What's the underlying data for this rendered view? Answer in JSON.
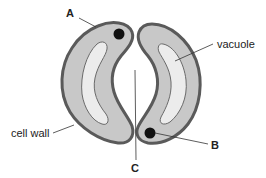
{
  "diagram": {
    "labels": {
      "a": "A",
      "b": "B",
      "c": "C",
      "vacuole": "vacuole",
      "cell_wall": "cell wall"
    },
    "colors": {
      "wall": "#5a5a5a",
      "cytoplasm": "#c8c8c8",
      "vacuole": "#ececec",
      "nucleus": "#111111",
      "leader": "#333333",
      "background": "#ffffff"
    }
  }
}
